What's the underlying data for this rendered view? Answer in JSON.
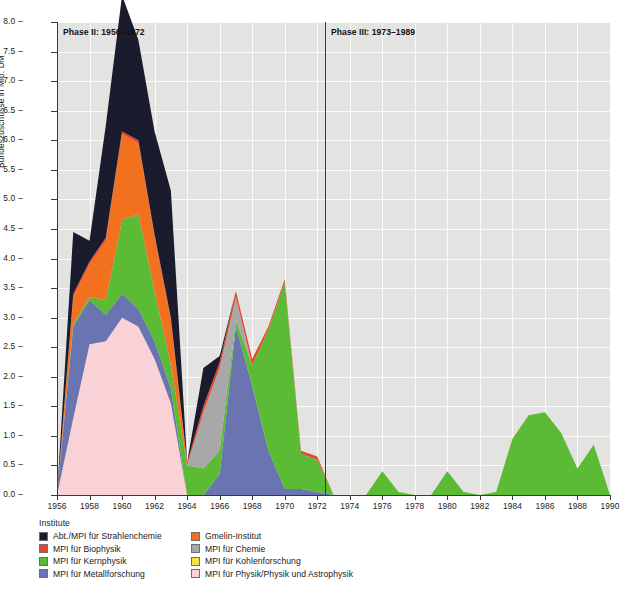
{
  "chart_data": {
    "type": "area",
    "stacked": true,
    "title": "",
    "xlabel": "",
    "ylabel": "Bundeszuschüsse in Mio. DM",
    "xlim": [
      1956,
      1990
    ],
    "ylim": [
      0.0,
      8.0
    ],
    "grid": true,
    "legend_position": "below",
    "legend_title": "Institute",
    "x_tick_labels": [
      "1956",
      "1958",
      "1960",
      "1962",
      "1964",
      "1966",
      "1968",
      "1970",
      "1972",
      "1974",
      "1976",
      "1978",
      "1980",
      "1982",
      "1984",
      "1986",
      "1988",
      "1990"
    ],
    "y_tick_labels": [
      "0.0",
      "0.5",
      "1.0",
      "1.5",
      "2.0",
      "2.5",
      "3.0",
      "3.5",
      "4.0",
      "4.5",
      "5.0",
      "5.5",
      "6.0",
      "6.5",
      "7.0",
      "7.5",
      "8.0"
    ],
    "annotations": [
      {
        "text": "Phase II: 1956–1972",
        "x": 1956.5,
        "y": 7.75
      },
      {
        "text": "Phase III: 1973–1989",
        "x": 1973.4,
        "y": 7.75
      }
    ],
    "vlines": [
      1973
    ],
    "x": [
      1956,
      1957,
      1958,
      1959,
      1960,
      1961,
      1962,
      1963,
      1964,
      1965,
      1966,
      1967,
      1968,
      1969,
      1970,
      1971,
      1972,
      1973,
      1974,
      1975,
      1976,
      1977,
      1978,
      1979,
      1980,
      1981,
      1982,
      1983,
      1984,
      1985,
      1986,
      1987,
      1988,
      1989,
      1990
    ],
    "series": [
      {
        "name": "MPI für Physik/Physik und Astrophysik",
        "color": "#f8d2d6",
        "values": [
          0.0,
          1.3,
          2.55,
          2.6,
          3.0,
          2.85,
          2.3,
          1.55,
          0.0,
          0.0,
          0.0,
          0.0,
          0.0,
          0.0,
          0.0,
          0.0,
          0.0,
          0.0,
          0.0,
          0.0,
          0.0,
          0.0,
          0.0,
          0.0,
          0.0,
          0.0,
          0.0,
          0.0,
          0.0,
          0.0,
          0.0,
          0.0,
          0.0,
          0.0,
          0.0
        ]
      },
      {
        "name": "MPI für Metallforschung",
        "color": "#6a74b0",
        "values": [
          0.0,
          1.55,
          0.75,
          0.45,
          0.4,
          0.3,
          0.3,
          0.25,
          0.0,
          0.0,
          0.35,
          2.85,
          1.85,
          0.75,
          0.1,
          0.1,
          0.05,
          0.0,
          0.0,
          0.0,
          0.0,
          0.0,
          0.0,
          0.0,
          0.0,
          0.0,
          0.0,
          0.0,
          0.0,
          0.0,
          0.0,
          0.0,
          0.0,
          0.0,
          0.0
        ]
      },
      {
        "name": "MPI für Kohlenforschung",
        "color": "#f7e04a",
        "values": [
          0.0,
          0.0,
          0.0,
          0.0,
          0.0,
          0.0,
          0.0,
          0.0,
          0.0,
          0.0,
          0.0,
          0.0,
          0.0,
          0.0,
          0.0,
          0.0,
          0.0,
          0.0,
          0.0,
          0.0,
          0.0,
          0.0,
          0.0,
          0.0,
          0.0,
          0.0,
          0.0,
          0.0,
          0.0,
          0.0,
          0.0,
          0.0,
          0.0,
          0.0,
          0.0
        ]
      },
      {
        "name": "MPI für Kernphysik",
        "color": "#5cbb35",
        "values": [
          0.0,
          0.05,
          0.05,
          0.25,
          1.25,
          1.6,
          0.85,
          0.4,
          0.5,
          0.45,
          0.4,
          0.1,
          0.35,
          2.05,
          3.5,
          0.6,
          0.55,
          0.0,
          0.0,
          0.0,
          0.4,
          0.05,
          0.0,
          0.0,
          0.4,
          0.05,
          0.0,
          0.05,
          0.95,
          1.35,
          1.4,
          1.05,
          0.45,
          0.85,
          0.0
        ]
      },
      {
        "name": "MPI für Chemie",
        "color": "#a8a8a8",
        "values": [
          0.0,
          0.0,
          0.0,
          0.0,
          0.0,
          0.0,
          0.0,
          0.0,
          0.0,
          0.95,
          1.4,
          0.4,
          0.0,
          0.0,
          0.0,
          0.0,
          0.0,
          0.0,
          0.0,
          0.0,
          0.0,
          0.0,
          0.0,
          0.0,
          0.0,
          0.0,
          0.0,
          0.0,
          0.0,
          0.0,
          0.0,
          0.0,
          0.0,
          0.0,
          0.0
        ]
      },
      {
        "name": "Gmelin-Institut",
        "color": "#f2711e",
        "values": [
          0.0,
          0.45,
          0.55,
          1.0,
          1.45,
          1.2,
          0.9,
          0.75,
          0.0,
          0.0,
          0.0,
          0.0,
          0.0,
          0.0,
          0.0,
          0.0,
          0.0,
          0.0,
          0.0,
          0.0,
          0.0,
          0.0,
          0.0,
          0.0,
          0.0,
          0.0,
          0.0,
          0.0,
          0.0,
          0.0,
          0.0,
          0.0,
          0.0,
          0.0,
          0.0
        ]
      },
      {
        "name": "MPI für Biophysik",
        "color": "#e8452e",
        "values": [
          0.0,
          0.05,
          0.05,
          0.05,
          0.05,
          0.05,
          0.05,
          0.05,
          0.05,
          0.1,
          0.1,
          0.1,
          0.1,
          0.05,
          0.05,
          0.05,
          0.05,
          0.0,
          0.0,
          0.0,
          0.0,
          0.0,
          0.0,
          0.0,
          0.0,
          0.0,
          0.0,
          0.0,
          0.0,
          0.0,
          0.0,
          0.0,
          0.0,
          0.0,
          0.0
        ]
      },
      {
        "name": "Abt./MPI für Strahlenchemie",
        "color": "#1b1b2e",
        "values": [
          0.0,
          1.05,
          0.35,
          1.9,
          2.3,
          1.7,
          1.75,
          2.15,
          0.0,
          0.65,
          0.1,
          0.0,
          0.0,
          0.0,
          0.0,
          0.0,
          0.0,
          0.0,
          0.0,
          0.0,
          0.0,
          0.0,
          0.0,
          0.0,
          0.0,
          0.0,
          0.0,
          0.0,
          0.0,
          0.0,
          0.0,
          0.0,
          0.0,
          0.0,
          0.0
        ]
      }
    ],
    "totals": [
      0.0,
      4.45,
      4.3,
      6.25,
      8.45,
      7.7,
      6.15,
      5.15,
      0.55,
      2.15,
      2.35,
      3.45,
      2.3,
      2.85,
      3.65,
      0.75,
      0.65,
      0.0,
      0.0,
      0.0,
      0.4,
      0.05,
      0.0,
      0.0,
      0.4,
      0.05,
      0.0,
      0.05,
      0.95,
      1.35,
      1.4,
      1.05,
      0.45,
      0.85,
      0.0
    ]
  },
  "legend": {
    "title": "Institute",
    "items": [
      {
        "label": "Abt./MPI für Strahlenchemie",
        "color": "#1b1b2e"
      },
      {
        "label": "Gmelin-Institut",
        "color": "#f2711e"
      },
      {
        "label": "MPI für Biophysik",
        "color": "#e8452e"
      },
      {
        "label": "MPI für Chemie",
        "color": "#a8a8a8"
      },
      {
        "label": "MPI für Kernphysik",
        "color": "#5cbb35"
      },
      {
        "label": "MPI für Kohlenforschung",
        "color": "#f7e04a"
      },
      {
        "label": "MPI für Metallforschung",
        "color": "#6a74b0"
      },
      {
        "label": "MPI für Physik/Physik und Astrophysik",
        "color": "#f8d2d6"
      }
    ]
  }
}
